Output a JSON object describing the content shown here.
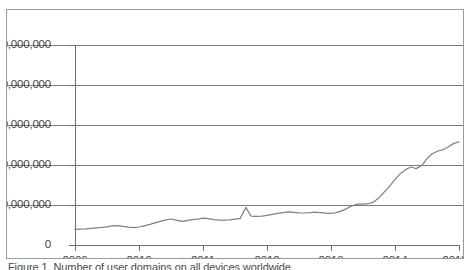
{
  "figure": {
    "caption": "Figure 1.  Number of user domains on all devices worldwide."
  },
  "chart_data": {
    "type": "line",
    "title": "",
    "subtitle": "",
    "xlabel": "",
    "ylabel": "",
    "grid": true,
    "legend": false,
    "legend_position": "none",
    "line_color": "#808080",
    "xlim": [
      2009,
      2015
    ],
    "ylim": [
      0,
      250000000
    ],
    "xtick_labels": [
      "2009",
      "2010",
      "2011",
      "2012",
      "2013",
      "2014",
      "2015"
    ],
    "xticks": [
      2009,
      2010,
      2011,
      2012,
      2013,
      2014,
      2015
    ],
    "ytick_labels": [
      "0",
      "50,000,000",
      "100,000,000",
      "150,000,000",
      "200,000,000",
      "250,000,000"
    ],
    "yticks": [
      0,
      50000000,
      100000000,
      150000000,
      200000000,
      250000000
    ],
    "series": [
      {
        "name": "Total",
        "x": [
          2009.0,
          2009.08,
          2009.17,
          2009.25,
          2009.33,
          2009.42,
          2009.5,
          2009.58,
          2009.67,
          2009.75,
          2009.83,
          2009.92,
          2010.0,
          2010.08,
          2010.17,
          2010.25,
          2010.33,
          2010.42,
          2010.5,
          2010.58,
          2010.67,
          2010.75,
          2010.83,
          2010.92,
          2011.0,
          2011.08,
          2011.17,
          2011.25,
          2011.33,
          2011.42,
          2011.5,
          2011.58,
          2011.67,
          2011.75,
          2011.83,
          2011.92,
          2012.0,
          2012.08,
          2012.17,
          2012.25,
          2012.33,
          2012.42,
          2012.5,
          2012.58,
          2012.67,
          2012.75,
          2012.83,
          2012.92,
          2013.0,
          2013.08,
          2013.17,
          2013.25,
          2013.33,
          2013.42,
          2013.5,
          2013.58,
          2013.67,
          2013.75,
          2013.83,
          2013.92,
          2014.0,
          2014.08,
          2014.17,
          2014.25,
          2014.33,
          2014.42,
          2014.5,
          2014.58,
          2014.67,
          2014.75,
          2014.83,
          2014.92,
          2015.0
        ],
        "values": [
          19500000,
          19800000,
          20200000,
          20800000,
          21500000,
          22000000,
          22600000,
          23900000,
          24300000,
          23200000,
          22300000,
          21800000,
          22500000,
          24000000,
          25800000,
          27600000,
          29500000,
          31300000,
          32500000,
          31000000,
          29400000,
          30600000,
          31800000,
          32300000,
          33600000,
          33000000,
          31800000,
          31200000,
          31000000,
          31400000,
          32200000,
          33200000,
          47000000,
          36200000,
          35800000,
          36200000,
          37000000,
          38200000,
          39400000,
          40600000,
          41300000,
          40800000,
          40200000,
          40000000,
          40400000,
          41200000,
          40600000,
          39800000,
          39600000,
          40400000,
          42600000,
          45800000,
          49000000,
          51200000,
          51000000,
          51600000,
          54000000,
          59000000,
          66000000,
          74000000,
          82000000,
          89000000,
          94500000,
          97500000,
          95500000,
          99500000,
          108000000,
          114000000,
          117500000,
          119000000,
          122500000,
          127000000,
          129000000
        ]
      }
    ],
    "annotations": []
  },
  "axes": {
    "y_ticks": [
      {
        "label": "250,000,000",
        "value": 250000000
      },
      {
        "label": "200,000,000",
        "value": 200000000
      },
      {
        "label": "150,000,000",
        "value": 150000000
      },
      {
        "label": "100,000,000",
        "value": 100000000
      },
      {
        "label": "50,000,000",
        "value": 50000000
      },
      {
        "label": "0",
        "value": 0
      }
    ],
    "x_ticks": [
      {
        "label": "2009",
        "value": 2009
      },
      {
        "label": "2010",
        "value": 2010
      },
      {
        "label": "2011",
        "value": 2011
      },
      {
        "label": "2012",
        "value": 2012
      },
      {
        "label": "2013",
        "value": 2013
      },
      {
        "label": "2014",
        "value": 2014
      },
      {
        "label": "2015",
        "value": 2015
      }
    ]
  }
}
